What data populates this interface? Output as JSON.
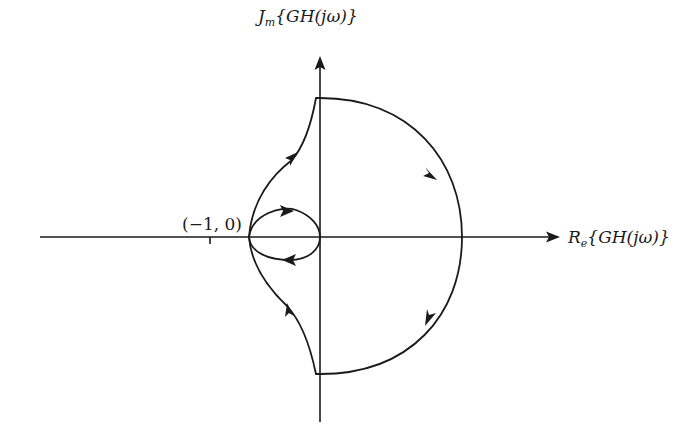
{
  "diagram": {
    "imag_axis_label": {
      "prefix": "J",
      "subscript": "m",
      "body": "{GH(jω)}"
    },
    "real_axis_label": {
      "prefix": "R",
      "subscript": "e",
      "body": "{GH(jω)}"
    },
    "critical_point_label": "(−1, 0)",
    "critical_point": [
      -1,
      0
    ],
    "curves": [
      {
        "name": "large-semicircle",
        "description": "Clockwise large arc from upper imaginary axis through positive real axis to lower imaginary axis",
        "direction": "clockwise"
      },
      {
        "name": "small-loop",
        "description": "Small closed loop between the -1 region and the origin, traversed clockwise (upper arc rightward, lower arc leftward)",
        "direction": "clockwise"
      },
      {
        "name": "upper-branch",
        "description": "Curve from left loop point rising to top of imaginary axis",
        "direction": "upward"
      },
      {
        "name": "lower-branch",
        "description": "Curve from bottom of imaginary axis rising to left loop point",
        "direction": "upward"
      }
    ],
    "colors": {
      "ink": "#1a1a1a",
      "background": "#ffffff"
    }
  }
}
